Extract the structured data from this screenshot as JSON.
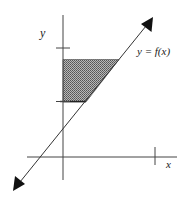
{
  "figure": {
    "type": "coordinate-diagram",
    "labels": {
      "y_axis": "y",
      "x_axis": "x",
      "curve": "y = f(x)"
    },
    "colors": {
      "axis": "#444444",
      "line": "#333333",
      "shade": "#8a8a8a",
      "arrowhead": "#111111",
      "background": "#ffffff"
    },
    "elements": {
      "y_axis_ticks": 2,
      "x_axis_ticks": 1,
      "shaded_region": "trapezoid between the y-axis, two horizontal levels and the line y = f(x)",
      "line_arrows": "both ends"
    }
  }
}
